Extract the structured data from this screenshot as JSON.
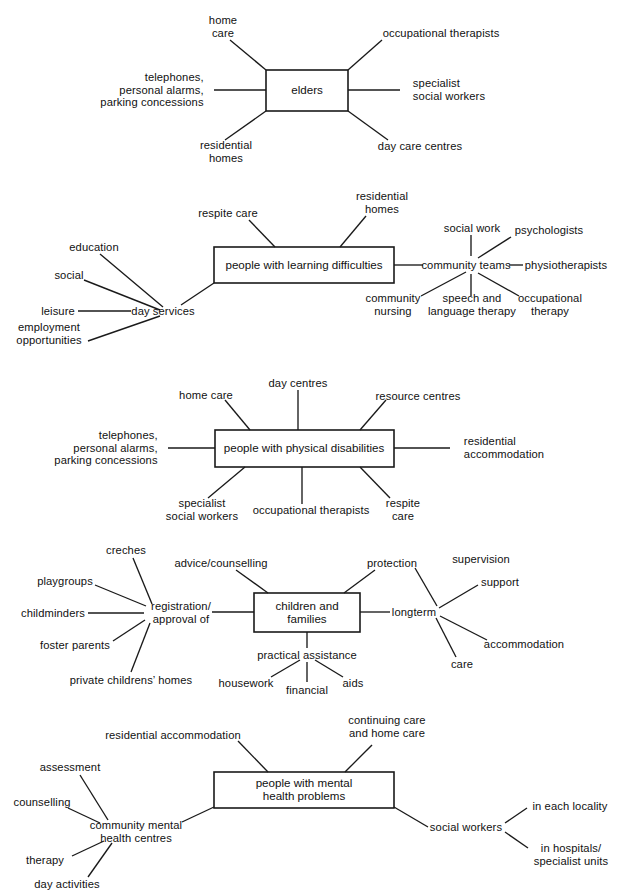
{
  "diagram": {
    "type": "mind-map-cluster-set",
    "title_visible": false,
    "panels": [
      {
        "id": "elders",
        "center_label": "elders",
        "branches": [
          "home\ncare",
          "occupational therapists",
          "telephones,\npersonal alarms,\nparking concessions",
          "specialist\nsocial workers",
          "residential\nhomes",
          "day care centres"
        ]
      },
      {
        "id": "learning-difficulties",
        "center_label": "people with learning difficulties",
        "branches": [
          "respite care",
          "residential\nhomes",
          "day services",
          "community teams"
        ],
        "sub_clusters": [
          {
            "hub": "day services",
            "items": [
              "education",
              "social",
              "leisure",
              "employment\nopportunities"
            ]
          },
          {
            "hub": "community teams",
            "items": [
              "social work",
              "psychologists",
              "physiotherapists",
              "community\nnursing",
              "speech and\nlanguage therapy",
              "occupational\ntherapy"
            ]
          }
        ]
      },
      {
        "id": "physical-disabilities",
        "center_label": "people with physical disabilities",
        "branches": [
          "home care",
          "day centres",
          "resource centres",
          "telephones,\npersonal alarms,\nparking concessions",
          "residential\naccommodation",
          "specialist\nsocial workers",
          "occupational therapists",
          "respite\ncare"
        ]
      },
      {
        "id": "children-and-families",
        "center_label": "children and\nfamilies",
        "branches": [
          "advice/counselling",
          "protection",
          "registration/\napproval of",
          "longterm",
          "practical assistance"
        ],
        "sub_clusters": [
          {
            "hub": "registration/\napproval of",
            "items": [
              "creches",
              "playgroups",
              "childminders",
              "foster parents",
              "private childrens’ homes"
            ]
          },
          {
            "hub": "longterm",
            "items": [
              "supervision",
              "support",
              "accommodation",
              "care"
            ]
          },
          {
            "hub": "practical assistance",
            "items": [
              "housework",
              "financial",
              "aids"
            ]
          }
        ]
      },
      {
        "id": "mental-health",
        "center_label": "people with mental\nhealth problems",
        "branches": [
          "residential accommodation",
          "continuing care\nand home care",
          "community mental\nhealth centres",
          "social workers"
        ],
        "sub_clusters": [
          {
            "hub": "community mental\nhealth centres",
            "items": [
              "assessment",
              "counselling",
              "therapy",
              "day activities"
            ]
          },
          {
            "hub": "social workers",
            "items": [
              "in each locality",
              "in hospitals/\nspecialist units"
            ]
          }
        ]
      }
    ]
  },
  "p1": {
    "center": "elders",
    "home_care": "home\ncare",
    "occupational_therapists": "occupational therapists",
    "telephones": "telephones,\npersonal alarms,\nparking concessions",
    "specialist_social_workers": "specialist\nsocial workers",
    "residential_homes": "residential\nhomes",
    "day_care_centres": "day care centres"
  },
  "p2": {
    "center": "people with learning difficulties",
    "respite_care": "respite care",
    "residential_homes": "residential\nhomes",
    "day_services": "day services",
    "education": "education",
    "social": "social",
    "leisure": "leisure",
    "employment": "employment\nopportunities",
    "community_teams": "community teams",
    "social_work": "social work",
    "psychologists": "psychologists",
    "physiotherapists": "physiotherapists",
    "community_nursing": "community\nnursing",
    "speech_language": "speech and\nlanguage therapy",
    "occupational_therapy": "occupational\ntherapy"
  },
  "p3": {
    "center": "people with physical disabilities",
    "home_care": "home care",
    "day_centres": "day centres",
    "resource_centres": "resource centres",
    "telephones": "telephones,\npersonal alarms,\nparking concessions",
    "residential_accommodation": "residential\naccommodation",
    "specialist_social_workers": "specialist\nsocial workers",
    "occupational_therapists": "occupational therapists",
    "respite_care": "respite\ncare"
  },
  "p4": {
    "center": "children and\nfamilies",
    "creches": "creches",
    "advice_counselling": "advice/counselling",
    "protection": "protection",
    "supervision": "supervision",
    "playgroups": "playgroups",
    "support": "support",
    "childminders": "childminders",
    "registration": "registration/\napproval of",
    "longterm": "longterm",
    "foster_parents": "foster parents",
    "accommodation": "accommodation",
    "private_homes": "private childrens’ homes",
    "practical_assistance": "practical assistance",
    "care": "care",
    "housework": "housework",
    "financial": "financial",
    "aids": "aids"
  },
  "p5": {
    "center": "people with mental\nhealth problems",
    "residential_accommodation": "residential accommodation",
    "continuing_care": "continuing care\nand home care",
    "assessment": "assessment",
    "counselling": "counselling",
    "cmhc": "community mental\nhealth centres",
    "therapy": "therapy",
    "day_activities": "day activities",
    "social_workers": "social workers",
    "in_each_locality": "in each locality",
    "in_hospitals": "in hospitals/\nspecialist units"
  },
  "colors": {
    "ink": "#111111",
    "line": "#1a1a1a",
    "paper": "#ffffff"
  }
}
